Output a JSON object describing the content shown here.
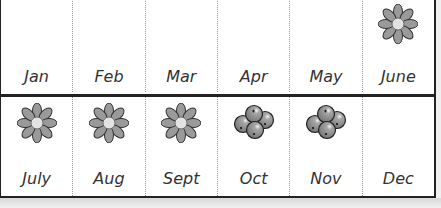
{
  "colors": {
    "petal": "#999999",
    "petal_outline": "#333333",
    "flower_center": "#e0e0e0",
    "berry": "#8a8a8a",
    "border": "#222222",
    "label": "#333333"
  },
  "rows": [
    {
      "months": [
        {
          "label": "Jan",
          "icon": "none"
        },
        {
          "label": "Feb",
          "icon": "none"
        },
        {
          "label": "Mar",
          "icon": "none"
        },
        {
          "label": "Apr",
          "icon": "none"
        },
        {
          "label": "May",
          "icon": "none"
        },
        {
          "label": "June",
          "icon": "flower-icon"
        }
      ]
    },
    {
      "months": [
        {
          "label": "July",
          "icon": "flower-icon"
        },
        {
          "label": "Aug",
          "icon": "flower-icon"
        },
        {
          "label": "Sept",
          "icon": "flower-icon"
        },
        {
          "label": "Oct",
          "icon": "berries-icon"
        },
        {
          "label": "Nov",
          "icon": "berries-icon"
        },
        {
          "label": "Dec",
          "icon": "none"
        }
      ]
    }
  ]
}
